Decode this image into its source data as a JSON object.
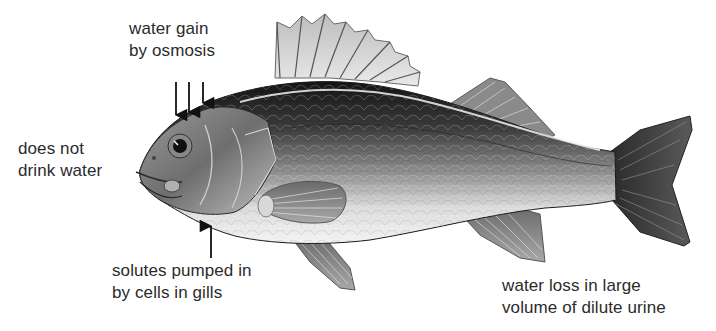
{
  "diagram": {
    "labels": {
      "water_gain": {
        "line1": "water gain",
        "line2": "by osmosis"
      },
      "no_drink": {
        "line1": "does not",
        "line2": "drink water"
      },
      "solutes": {
        "line1": "solutes pumped in",
        "line2": "by cells in gills"
      },
      "urine": {
        "line1": "water loss in large",
        "line2": "volume of dilute urine"
      }
    },
    "arrows": [
      {
        "name": "water-gain-arrow-1",
        "direction": "down"
      },
      {
        "name": "water-gain-arrow-2",
        "direction": "down"
      },
      {
        "name": "water-gain-arrow-3",
        "direction": "down"
      },
      {
        "name": "solutes-arrow",
        "direction": "up"
      }
    ],
    "colors": {
      "text": "#2b2b2b",
      "arrow": "#111111",
      "fish_dark": "#1e1e1e",
      "fish_mid": "#7a7a7a",
      "fish_light": "#e6e6e6"
    }
  }
}
